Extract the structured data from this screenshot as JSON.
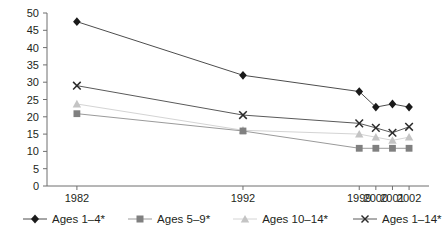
{
  "chart_data": {
    "type": "line",
    "title": "",
    "subtitle": "",
    "xlabel": "",
    "ylabel": "",
    "categories": [
      "1982",
      "1992",
      "1999",
      "2000",
      "2001",
      "2002"
    ],
    "x_positions": [
      1982,
      1992,
      1999,
      2000,
      2001,
      2002
    ],
    "xlim": [
      1980.2,
      2003.2
    ],
    "ylim": [
      0,
      50
    ],
    "y_ticks": [
      0,
      5,
      10,
      15,
      20,
      25,
      30,
      35,
      40,
      45,
      50
    ],
    "grid": false,
    "legend_position": "bottom",
    "series": [
      {
        "name": "Ages 1–4*",
        "marker": "diamond",
        "color": "#1a1a1a",
        "line_color": "#4d4d4d",
        "values": [
          47.5,
          32.0,
          27.3,
          22.8,
          23.7,
          22.8
        ]
      },
      {
        "name": "Ages 5–9*",
        "marker": "square",
        "color": "#808080",
        "line_color": "#9a9a9a",
        "values": [
          20.9,
          15.9,
          10.9,
          10.9,
          10.9,
          10.9
        ]
      },
      {
        "name": "Ages 10–14*",
        "marker": "triangle",
        "color": "#c4c4c4",
        "line_color": "#d4d4d4",
        "values": [
          23.7,
          16.1,
          15.0,
          14.1,
          13.2,
          14.1
        ]
      },
      {
        "name": "Ages 1–14*",
        "marker": "x",
        "color": "#2b2b2b",
        "line_color": "#5a5a5a",
        "values": [
          29.0,
          20.5,
          18.1,
          16.8,
          15.4,
          17.1
        ]
      }
    ]
  },
  "axis": {
    "y_tick_labels": [
      "0",
      "5",
      "10",
      "15",
      "20",
      "25",
      "30",
      "35",
      "40",
      "45",
      "50"
    ],
    "x_tick_labels": [
      "1982",
      "1992",
      "1999",
      "2000",
      "2001",
      "2002"
    ]
  },
  "legend": {
    "items": [
      {
        "label": "Ages 1–4*",
        "marker": "diamond-marker",
        "color": "#1a1a1a"
      },
      {
        "label": "Ages 5–9*",
        "marker": "square-marker",
        "color": "#808080"
      },
      {
        "label": "Ages 10–14*",
        "marker": "triangle-marker",
        "color": "#c4c4c4"
      },
      {
        "label": "Ages 1–14*",
        "marker": "x-marker",
        "color": "#2b2b2b"
      }
    ]
  }
}
